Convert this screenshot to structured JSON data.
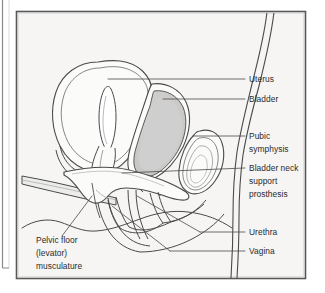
{
  "figure": {
    "type": "medical-illustration",
    "view": "sagittal-section-female-pelvis",
    "background_color": "#f6f5f3",
    "frame_color": "#58585a",
    "line_color": "#4a4a4a",
    "fill_gray": "#cfcfcf",
    "fill_light": "#e8e7e5",
    "fill_white": "#fbfbfa",
    "text_color": "#2b2b2b"
  },
  "labels": {
    "uterus": "Uterus",
    "bladder": "Bladder",
    "pubic_symphysis_line1": "Pubic",
    "pubic_symphysis_line2": "symphysis",
    "prosthesis_line1": "Bladder neck",
    "prosthesis_line2": "support",
    "prosthesis_line3": "prosthesis",
    "urethra": "Urethra",
    "vagina": "Vagina",
    "pelvic_floor_line1": "Pelvic floor",
    "pelvic_floor_line2": "(levator)",
    "pelvic_floor_line3": "musculature"
  },
  "structures": [
    {
      "name": "uterus",
      "label": "Uterus"
    },
    {
      "name": "bladder",
      "label": "Bladder"
    },
    {
      "name": "pubic-symphysis",
      "label": "Pubic symphysis"
    },
    {
      "name": "bladder-neck-support-prosthesis",
      "label": "Bladder neck support prosthesis"
    },
    {
      "name": "urethra",
      "label": "Urethra"
    },
    {
      "name": "vagina",
      "label": "Vagina"
    },
    {
      "name": "pelvic-floor-levator-musculature",
      "label": "Pelvic floor (levator) musculature"
    }
  ]
}
